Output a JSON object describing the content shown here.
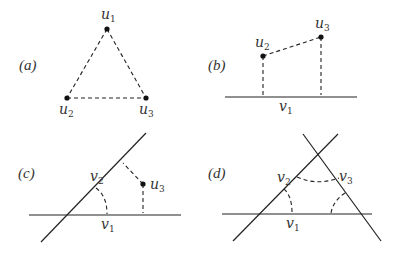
{
  "figure": {
    "panels": [
      {
        "id": "a",
        "label": "(a)",
        "points": [
          {
            "name": "u1",
            "base": "u",
            "sub": "1"
          },
          {
            "name": "u2",
            "base": "u",
            "sub": "2"
          },
          {
            "name": "u3",
            "base": "u",
            "sub": "3"
          }
        ],
        "description": "Dashed triangle connecting three points u1, u2, u3"
      },
      {
        "id": "b",
        "label": "(b)",
        "points": [
          {
            "name": "u2",
            "base": "u",
            "sub": "2"
          },
          {
            "name": "u3",
            "base": "u",
            "sub": "3"
          }
        ],
        "lines": [
          {
            "name": "v1",
            "base": "v",
            "sub": "1"
          }
        ],
        "description": "Points u2 and u3 joined by dashed segment with dashed perpendiculars to solid line v1"
      },
      {
        "id": "c",
        "label": "(c)",
        "points": [
          {
            "name": "u3",
            "base": "u",
            "sub": "3"
          }
        ],
        "lines": [
          {
            "name": "v1",
            "base": "v",
            "sub": "1"
          },
          {
            "name": "v2",
            "base": "v",
            "sub": "2"
          }
        ],
        "description": "Two intersecting lines v1 and v2 with dashed angle arc; point u3 with dashed perpendiculars to both lines"
      },
      {
        "id": "d",
        "label": "(d)",
        "lines": [
          {
            "name": "v1",
            "base": "v",
            "sub": "1"
          },
          {
            "name": "v2",
            "base": "v",
            "sub": "2"
          },
          {
            "name": "v3",
            "base": "v",
            "sub": "3"
          }
        ],
        "description": "Three lines v1, v2, v3 forming a triangle with dashed angle arcs at each vertex"
      }
    ]
  }
}
